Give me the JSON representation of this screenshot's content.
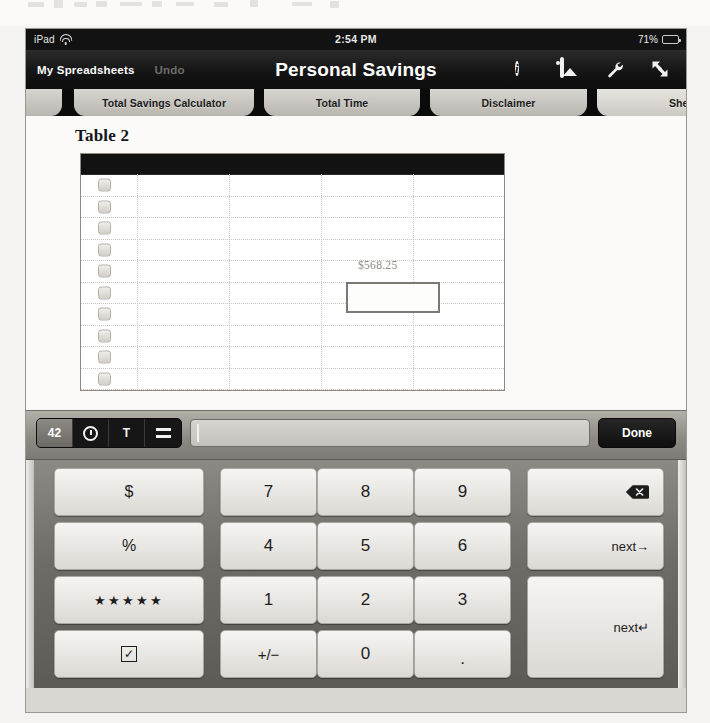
{
  "status_bar": {
    "carrier": "iPad",
    "wifi_icon": "wifi-icon",
    "time": "2:54 PM",
    "battery_percent": "71%",
    "battery_icon": "battery-icon"
  },
  "toolbar": {
    "back_label": "My Spreadsheets",
    "undo_label": "Undo",
    "title": "Personal Savings",
    "icons": [
      {
        "name": "info-icon",
        "glyph": "i"
      },
      {
        "name": "image-icon",
        "glyph": ""
      },
      {
        "name": "wrench-icon",
        "glyph": ""
      },
      {
        "name": "fullscreen-icon",
        "glyph": ""
      }
    ]
  },
  "tabs": [
    {
      "label": "le...",
      "active": false
    },
    {
      "label": "Total Savings Calculator",
      "active": false
    },
    {
      "label": "Total Time",
      "active": false
    },
    {
      "label": "Disclaimer",
      "active": false
    },
    {
      "label": "Sheet",
      "active": true
    }
  ],
  "sheet": {
    "table_title": "Table 2",
    "header_row_blank": "",
    "row_count": 10,
    "checkbox_icon": "checkbox-cell-icon",
    "cell_value": "$568.25",
    "selected_cell_value": ""
  },
  "formula_bar": {
    "format_buttons": [
      {
        "name": "number-format-button",
        "label": "42",
        "selected": true
      },
      {
        "name": "datetime-format-button",
        "label": "",
        "selected": false
      },
      {
        "name": "text-format-button",
        "label": "T",
        "selected": false
      },
      {
        "name": "formula-format-button",
        "label": "",
        "selected": false
      }
    ],
    "input_value": "",
    "done_label": "Done"
  },
  "keyboard": {
    "rows": [
      [
        {
          "name": "key-dollar",
          "label": "$",
          "type": "sym"
        },
        {
          "name": "key-7",
          "label": "7",
          "type": "num"
        },
        {
          "name": "key-8",
          "label": "8",
          "type": "num"
        },
        {
          "name": "key-9",
          "label": "9",
          "type": "num"
        },
        {
          "name": "key-backspace",
          "label": "",
          "type": "backspace"
        }
      ],
      [
        {
          "name": "key-percent",
          "label": "%",
          "type": "sym"
        },
        {
          "name": "key-4",
          "label": "4",
          "type": "num"
        },
        {
          "name": "key-5",
          "label": "5",
          "type": "num"
        },
        {
          "name": "key-6",
          "label": "6",
          "type": "num"
        },
        {
          "name": "key-next-right",
          "label": "next→",
          "type": "wide"
        }
      ],
      [
        {
          "name": "key-star-rating",
          "label": "★★★★★",
          "type": "stars"
        },
        {
          "name": "key-1",
          "label": "1",
          "type": "num"
        },
        {
          "name": "key-2",
          "label": "2",
          "type": "num"
        },
        {
          "name": "key-3",
          "label": "3",
          "type": "num"
        },
        {
          "name": "key-next-return",
          "label": "next↵",
          "type": "wide-tall"
        }
      ],
      [
        {
          "name": "key-checkbox",
          "label": "✓",
          "type": "checkbox"
        },
        {
          "name": "key-plus-minus",
          "label": "+/−",
          "type": "sym"
        },
        {
          "name": "key-0",
          "label": "0",
          "type": "num"
        },
        {
          "name": "key-period",
          "label": ".",
          "type": "dot"
        }
      ]
    ]
  },
  "colors": {
    "toolbar_bg": "#131313",
    "tab_bg": "#c9c6c0",
    "keyboard_bg": "#6f6c67",
    "key_face": "#eceae6",
    "sheet_bg": "#fbfaf8",
    "selection_border": "#7c7974"
  }
}
